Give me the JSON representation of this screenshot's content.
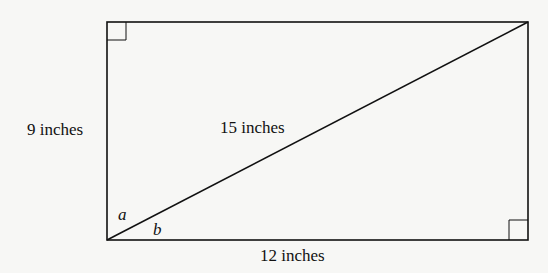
{
  "diagram": {
    "type": "rectangle-with-diagonal",
    "labels": {
      "left_side": "9 inches",
      "diagonal": "15 inches",
      "bottom_side": "12 inches",
      "angle_a": "a",
      "angle_b": "b"
    },
    "right_angle_marks": [
      "top-left",
      "bottom-right"
    ],
    "colors": {
      "stroke": "#111111",
      "background": "#f7f7f5"
    }
  }
}
